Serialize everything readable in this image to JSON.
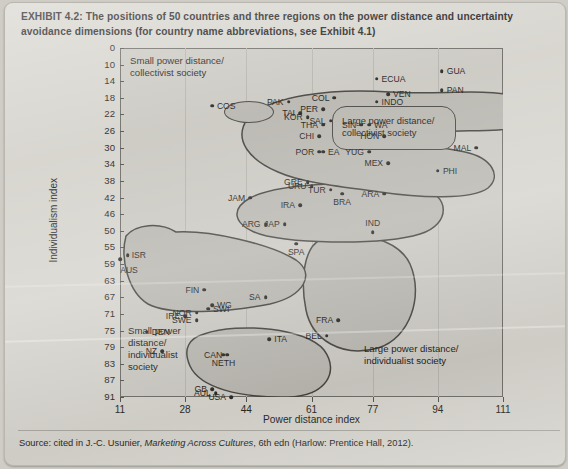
{
  "caption": "EXHIBIT 4.2:  The positions of 50 countries and three regions on the power distance and uncertainty avoidance dimensions (for country name abbreviations, see Exhibit 4.1)",
  "source": {
    "prefix": "Source: cited in J.-C. Usunier, ",
    "italic": "Marketing Across Cultures",
    "suffix": ", 6th edn (Harlow: Prentice Hall, 2012)."
  },
  "annotations": {
    "small_power_collectivist": "Small power distance/\ncollectivist society",
    "large_power_collectivist": "Large power distance/\ncollectivist society",
    "small_power_individualist": "Small power\ndistance/\nindividualist\nsociety",
    "large_power_individualist": "Large power distance/\nindividualist society"
  },
  "chart_data": {
    "type": "scatter",
    "title": "The positions of 50 countries and three regions on the power distance and uncertainty avoidance dimensions",
    "xlabel": "Power distance index",
    "ylabel": "Individualism index",
    "xticks": [
      11,
      28,
      44,
      61,
      77,
      94,
      111
    ],
    "yticks": [
      0,
      10,
      14,
      18,
      22,
      26,
      30,
      34,
      38,
      42,
      46,
      50,
      55,
      59,
      63,
      67,
      71,
      75,
      79,
      83,
      87,
      91
    ],
    "xlim": [
      11,
      111
    ],
    "ylim": [
      0,
      91
    ],
    "grid": "vertical",
    "legend": "none",
    "points": [
      {
        "label": "COS",
        "x": 35,
        "y": 15
      },
      {
        "label": "PAK",
        "x": 55,
        "y": 14
      },
      {
        "label": "COL",
        "x": 67,
        "y": 13
      },
      {
        "label": "ECUA",
        "x": 78,
        "y": 8
      },
      {
        "label": "GUA",
        "x": 95,
        "y": 6
      },
      {
        "label": "VEN",
        "x": 81,
        "y": 12
      },
      {
        "label": "PAN",
        "x": 95,
        "y": 11
      },
      {
        "label": "INDO",
        "x": 78,
        "y": 14
      },
      {
        "label": "TAI",
        "x": 58,
        "y": 17
      },
      {
        "label": "PER",
        "x": 64,
        "y": 16
      },
      {
        "label": "KOR",
        "x": 60,
        "y": 18
      },
      {
        "label": "SIN",
        "x": 74,
        "y": 20
      },
      {
        "label": "SAL",
        "x": 66,
        "y": 19
      },
      {
        "label": "THA",
        "x": 64,
        "y": 20
      },
      {
        "label": "WA",
        "x": 76,
        "y": 20
      },
      {
        "label": "CHI",
        "x": 63,
        "y": 23
      },
      {
        "label": "HON",
        "x": 80,
        "y": 23
      },
      {
        "label": "POR",
        "x": 63,
        "y": 27
      },
      {
        "label": "YUG",
        "x": 76,
        "y": 27
      },
      {
        "label": "EA",
        "x": 64,
        "y": 27
      },
      {
        "label": "MAL",
        "x": 104,
        "y": 26
      },
      {
        "label": "MEX",
        "x": 81,
        "y": 30
      },
      {
        "label": "PHI",
        "x": 94,
        "y": 32
      },
      {
        "label": "GRE",
        "x": 60,
        "y": 35
      },
      {
        "label": "URU",
        "x": 61,
        "y": 36
      },
      {
        "label": "TUR",
        "x": 66,
        "y": 37
      },
      {
        "label": "JAM",
        "x": 45,
        "y": 39
      },
      {
        "label": "IRA",
        "x": 58,
        "y": 41
      },
      {
        "label": "BRA",
        "x": 69,
        "y": 38
      },
      {
        "label": "ARA",
        "x": 80,
        "y": 38
      },
      {
        "label": "ARG",
        "x": 49,
        "y": 46
      },
      {
        "label": "JAP",
        "x": 54,
        "y": 46
      },
      {
        "label": "IND",
        "x": 77,
        "y": 48
      },
      {
        "label": "ISR",
        "x": 13,
        "y": 54
      },
      {
        "label": "AUS",
        "x": 11,
        "y": 55
      },
      {
        "label": "SPA",
        "x": 57,
        "y": 51
      },
      {
        "label": "FIN",
        "x": 33,
        "y": 63
      },
      {
        "label": "WG",
        "x": 35,
        "y": 67
      },
      {
        "label": "SA",
        "x": 49,
        "y": 65
      },
      {
        "label": "NOR",
        "x": 31,
        "y": 69
      },
      {
        "label": "SWI",
        "x": 34,
        "y": 68
      },
      {
        "label": "IRE",
        "x": 28,
        "y": 70
      },
      {
        "label": "SWE",
        "x": 31,
        "y": 71
      },
      {
        "label": "FRA",
        "x": 68,
        "y": 71
      },
      {
        "label": "DEN",
        "x": 18,
        "y": 74
      },
      {
        "label": "BEL",
        "x": 65,
        "y": 75
      },
      {
        "label": "ITA",
        "x": 50,
        "y": 76
      },
      {
        "label": "NZ",
        "x": 22,
        "y": 79
      },
      {
        "label": "CAN",
        "x": 39,
        "y": 80
      },
      {
        "label": "NETH",
        "x": 38,
        "y": 80
      },
      {
        "label": "GB",
        "x": 35,
        "y": 89
      },
      {
        "label": "USA",
        "x": 40,
        "y": 91
      },
      {
        "label": "AUL",
        "x": 36,
        "y": 90
      }
    ]
  }
}
